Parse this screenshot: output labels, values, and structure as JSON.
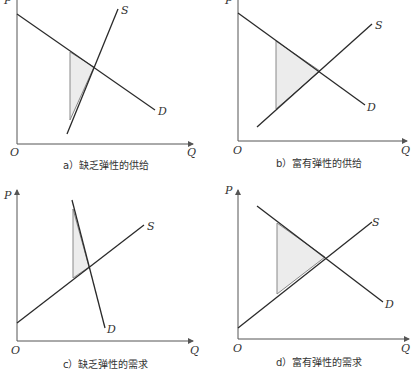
{
  "figure": {
    "panels": [
      {
        "id": "a",
        "caption": "a）缺乏弹性的供给",
        "origin_label": "O",
        "x_axis_label": "Q",
        "y_axis_label": "P",
        "supply_label": "S",
        "demand_label": "D",
        "supply_elasticity": "inelastic",
        "demand_elasticity": "moderate"
      },
      {
        "id": "b",
        "caption": "b）富有弹性的供给",
        "origin_label": "O",
        "x_axis_label": "Q",
        "y_axis_label": "P",
        "supply_label": "S",
        "demand_label": "D",
        "supply_elasticity": "elastic",
        "demand_elasticity": "moderate"
      },
      {
        "id": "c",
        "caption": "c）缺乏弹性的需求",
        "origin_label": "O",
        "x_axis_label": "Q",
        "y_axis_label": "P",
        "supply_label": "S",
        "demand_label": "D",
        "supply_elasticity": "moderate",
        "demand_elasticity": "inelastic"
      },
      {
        "id": "d",
        "caption": "d）富有弹性的需求",
        "origin_label": "O",
        "x_axis_label": "Q",
        "y_axis_label": "P",
        "supply_label": "S",
        "demand_label": "D",
        "supply_elasticity": "moderate",
        "demand_elasticity": "elastic"
      }
    ],
    "colors": {
      "line": "#2a2a2a",
      "axis": "#555555",
      "shade_fill": "#ececec",
      "text": "#333333"
    }
  }
}
